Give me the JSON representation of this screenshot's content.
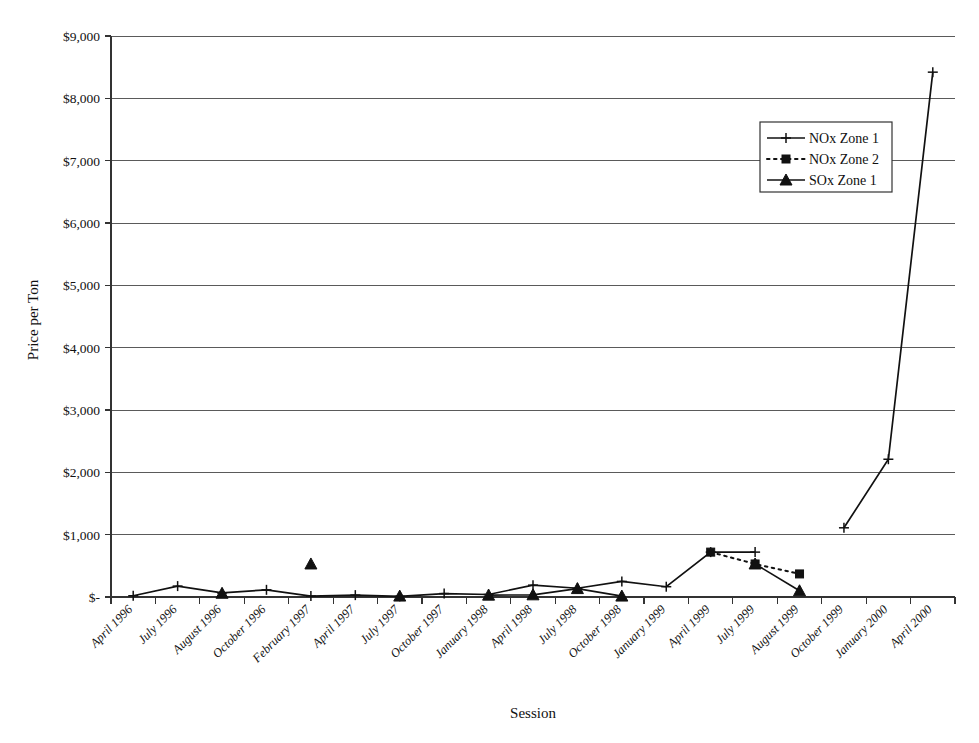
{
  "chart_data": {
    "type": "line",
    "title": "",
    "xlabel": "Session",
    "ylabel": "Price per Ton",
    "ylim": [
      0,
      9000
    ],
    "ytick_values": [
      0,
      1000,
      2000,
      3000,
      4000,
      5000,
      6000,
      7000,
      8000,
      9000
    ],
    "ytick_labels": [
      "$-",
      "$1,000",
      "$2,000",
      "$3,000",
      "$4,000",
      "$5,000",
      "$6,000",
      "$7,000",
      "$8,000",
      "$9,000"
    ],
    "grid": true,
    "legend_position": "upper right",
    "categories": [
      "April 1996",
      "July 1996",
      "August 1996",
      "October 1996",
      "February 1997",
      "April 1997",
      "July 1997",
      "October 1997",
      "January 1998",
      "April 1998",
      "July 1998",
      "October 1998",
      "January 1999",
      "April 1999",
      "July 1999",
      "August 1999",
      "October 1999",
      "January 2000",
      "April 2000"
    ],
    "series": [
      {
        "name": "NOx Zone 1",
        "marker": "plus",
        "line_style": "solid",
        "color": "#111111",
        "values": [
          20,
          175,
          65,
          115,
          15,
          30,
          10,
          55,
          40,
          190,
          140,
          250,
          165,
          720,
          720,
          null,
          1110,
          2210,
          8420
        ]
      },
      {
        "name": "NOx Zone 2",
        "marker": "square",
        "line_style": "dotted",
        "color": "#111111",
        "values": [
          null,
          null,
          null,
          null,
          null,
          null,
          null,
          null,
          null,
          null,
          null,
          null,
          null,
          720,
          530,
          370,
          null,
          null,
          null
        ]
      },
      {
        "name": "SOx Zone 1",
        "marker": "triangle",
        "line_style": "solid",
        "color": "#111111",
        "values": [
          null,
          null,
          60,
          null,
          530,
          null,
          15,
          null,
          30,
          35,
          135,
          15,
          null,
          null,
          530,
          100,
          null,
          null,
          null
        ]
      }
    ]
  },
  "legend": {
    "entries": [
      {
        "label": "NOx Zone 1"
      },
      {
        "label": "NOx Zone 2"
      },
      {
        "label": "SOx Zone 1"
      }
    ]
  },
  "axes": {
    "y_title": "Price per Ton",
    "x_title": "Session"
  }
}
